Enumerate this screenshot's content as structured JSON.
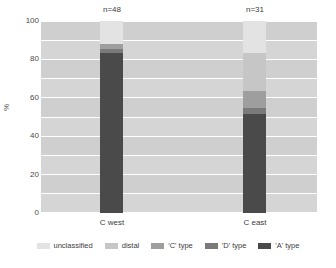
{
  "chart_data": {
    "type": "bar",
    "subtype": "stacked-percentage",
    "title": "",
    "xlabel": "",
    "ylabel": "%",
    "ylim": [
      0,
      100
    ],
    "yticks": [
      0,
      20,
      40,
      60,
      80,
      100
    ],
    "ytick_labels": [
      "0",
      "20",
      "40",
      "60",
      "80",
      "100"
    ],
    "grid": true,
    "grid_orientation": "horizontal",
    "legend_position": "bottom",
    "categories": [
      "C west",
      "C east"
    ],
    "category_counts": [
      "n=48",
      "n=31"
    ],
    "series": [
      {
        "name": "unclassified",
        "color": "#e3e3e3",
        "values": [
          12.0,
          16.5
        ]
      },
      {
        "name": "distal",
        "color": "#c6c6c6",
        "values": [
          0.0,
          20.0
        ]
      },
      {
        "name": "'C' type",
        "color": "#9e9e9e",
        "values": [
          2.5,
          9.0
        ]
      },
      {
        "name": "'D' type",
        "color": "#7a7a7a",
        "values": [
          2.0,
          3.0
        ]
      },
      {
        "name": "'A' type",
        "color": "#4a4a4a",
        "values": [
          83.5,
          51.5
        ]
      }
    ],
    "legend": [
      "unclassified",
      "distal",
      "'C' type",
      "'D' type",
      "'A' type"
    ],
    "palette": {
      "plot_background": "#d5d5d5",
      "band": "#cfcfcf",
      "gridline": "#ffffff",
      "text": "#3d3d3d",
      "axis_text": "#4a4a4a"
    }
  },
  "axes": {
    "y_title": "%",
    "y_tick_labels": [
      "100",
      "80",
      "60",
      "40",
      "20",
      "0"
    ],
    "x_tick_labels": [
      "C west",
      "C east"
    ]
  },
  "annotations": {
    "left_count": "n=48",
    "right_count": "n=31"
  },
  "legend": {
    "items": [
      {
        "label": "unclassified"
      },
      {
        "label": "distal"
      },
      {
        "label": "'C' type"
      },
      {
        "label": "'D' type"
      },
      {
        "label": "'A' type"
      }
    ]
  }
}
